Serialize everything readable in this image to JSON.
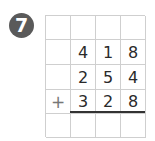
{
  "problem": {
    "number": "7",
    "badge_color": "#5a5a5a",
    "rows": [
      [
        "",
        "",
        "",
        ""
      ],
      [
        "",
        "4",
        "1",
        "8"
      ],
      [
        "",
        "2",
        "5",
        "4"
      ],
      [
        "+",
        "3",
        "2",
        "8"
      ],
      [
        "",
        "",
        "",
        ""
      ]
    ]
  }
}
